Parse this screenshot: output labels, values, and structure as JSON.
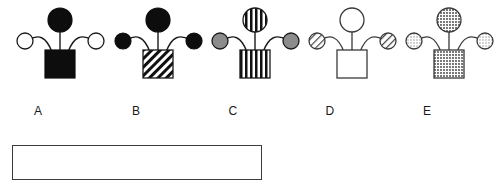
{
  "page": {
    "background_color": "#ffffff",
    "stroke_color": "#1a1a1a",
    "width": 501,
    "height": 188
  },
  "diagram": {
    "type": "molecular-structure-row",
    "figures": [
      {
        "id": "A",
        "label": "A",
        "label_x": 38,
        "origin_x": 0,
        "square": {
          "fill": "black",
          "pattern": "solid-black",
          "x": 45,
          "y": 50,
          "w": 30,
          "h": 28
        },
        "top_circle": {
          "fill": "black",
          "pattern": "solid-black",
          "cx": 60,
          "cy": 20,
          "r": 12
        },
        "left_circle": {
          "fill": "white",
          "pattern": "open",
          "cx": 25,
          "cy": 41,
          "r": 8
        },
        "right_circle": {
          "fill": "white",
          "pattern": "open",
          "cx": 96,
          "cy": 41,
          "r": 8
        }
      },
      {
        "id": "B",
        "label": "B",
        "label_x": 136,
        "origin_x": 98,
        "square": {
          "fill": "white",
          "pattern": "diagonal-hatch",
          "x": 45,
          "y": 50,
          "w": 30,
          "h": 28
        },
        "top_circle": {
          "fill": "black",
          "pattern": "solid-black",
          "cx": 60,
          "cy": 20,
          "r": 12
        },
        "left_circle": {
          "fill": "black",
          "pattern": "solid-black",
          "cx": 25,
          "cy": 41,
          "r": 8
        },
        "right_circle": {
          "fill": "black",
          "pattern": "solid-black",
          "cx": 96,
          "cy": 41,
          "r": 8
        }
      },
      {
        "id": "C",
        "label": "C",
        "label_x": 233,
        "origin_x": 195,
        "square": {
          "fill": "white",
          "pattern": "vertical-stripes",
          "x": 45,
          "y": 50,
          "w": 30,
          "h": 28
        },
        "top_circle": {
          "fill": "white",
          "pattern": "vertical-stripes",
          "cx": 60,
          "cy": 20,
          "r": 12
        },
        "left_circle": {
          "fill": "gray",
          "pattern": "solid-gray",
          "cx": 25,
          "cy": 41,
          "r": 8
        },
        "right_circle": {
          "fill": "gray",
          "pattern": "solid-gray",
          "cx": 96,
          "cy": 41,
          "r": 8
        }
      },
      {
        "id": "D",
        "label": "D",
        "label_x": 330,
        "origin_x": 292,
        "square": {
          "fill": "white",
          "pattern": "open",
          "x": 45,
          "y": 50,
          "w": 30,
          "h": 28
        },
        "top_circle": {
          "fill": "white",
          "pattern": "open",
          "cx": 60,
          "cy": 20,
          "r": 12
        },
        "left_circle": {
          "fill": "white",
          "pattern": "diagonal-hatch",
          "cx": 25,
          "cy": 41,
          "r": 8
        },
        "right_circle": {
          "fill": "white",
          "pattern": "diagonal-hatch",
          "cx": 96,
          "cy": 41,
          "r": 8
        }
      },
      {
        "id": "E",
        "label": "E",
        "label_x": 427,
        "origin_x": 389,
        "square": {
          "fill": "white",
          "pattern": "dotted",
          "x": 45,
          "y": 50,
          "w": 30,
          "h": 28
        },
        "top_circle": {
          "fill": "white",
          "pattern": "dotted",
          "cx": 60,
          "cy": 20,
          "r": 12
        },
        "left_circle": {
          "fill": "white",
          "pattern": "dotted-light",
          "cx": 25,
          "cy": 41,
          "r": 8
        },
        "right_circle": {
          "fill": "white",
          "pattern": "dotted-light",
          "cx": 96,
          "cy": 41,
          "r": 8
        }
      }
    ]
  },
  "answer_box": {
    "label": "answer-area",
    "content": "",
    "x": 12,
    "y": 145,
    "width": 250,
    "height": 35,
    "border_color": "#3c3c3c"
  }
}
